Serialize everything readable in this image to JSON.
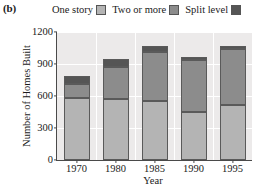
{
  "panel": {
    "label": "(b)"
  },
  "legend": {
    "position": "top",
    "entries": [
      {
        "label": "One story",
        "color": "#b4b4b4",
        "swatch_name": "legend-swatch-one-story"
      },
      {
        "label": "Two or more",
        "color": "#8c8c8c",
        "swatch_name": "legend-swatch-two-or-more"
      },
      {
        "label": "Split level",
        "color": "#555555",
        "swatch_name": "legend-swatch-split-level"
      }
    ]
  },
  "axes": {
    "xlabel": "Year",
    "ylabel": "Number of Homes Built",
    "yticks": [
      "0",
      "300",
      "600",
      "900",
      "1200"
    ],
    "xticks": [
      "1970",
      "1980",
      "1985",
      "1990",
      "1995"
    ]
  },
  "chart_data": {
    "type": "bar",
    "title": "",
    "subtitle": "",
    "xlabel": "Year",
    "ylabel": "Number of Homes Built",
    "categories": [
      "1970",
      "1980",
      "1985",
      "1990",
      "1995"
    ],
    "series": [
      {
        "name": "One story",
        "color": "#b4b4b4",
        "values": [
          580,
          575,
          555,
          450,
          515
        ]
      },
      {
        "name": "Two or more",
        "color": "#8c8c8c",
        "values": [
          130,
          295,
          455,
          485,
          530
        ]
      },
      {
        "name": "Split level",
        "color": "#555555",
        "values": [
          80,
          80,
          60,
          30,
          25
        ]
      }
    ],
    "cumulative_tops": {
      "one_story": [
        580,
        575,
        555,
        450,
        515
      ],
      "two_or_more": [
        710,
        870,
        1010,
        935,
        1045
      ],
      "split_level": [
        790,
        950,
        1070,
        965,
        1070
      ]
    },
    "totals": [
      790,
      950,
      1070,
      965,
      1070
    ],
    "stacked": true,
    "ylim": [
      0,
      1200
    ],
    "ytick_step": 300,
    "grid": true,
    "grid_color": "#ffffff",
    "plot_background": "#eceaea",
    "legend_position": "top"
  }
}
